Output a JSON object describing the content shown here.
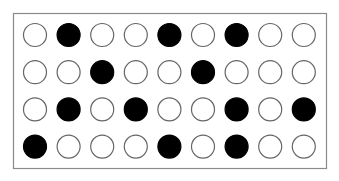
{
  "figure": {
    "rows": 4,
    "columns": 9,
    "colors": {
      "background": "#ffffff",
      "frame_stroke": "#8a8a8a",
      "circle_stroke": "#666666",
      "filled": "#000000",
      "hollow": "#ffffff"
    },
    "grid": [
      [
        0,
        1,
        0,
        0,
        1,
        0,
        1,
        0,
        0
      ],
      [
        0,
        0,
        1,
        0,
        0,
        1,
        0,
        0,
        0
      ],
      [
        0,
        1,
        0,
        1,
        0,
        0,
        1,
        0,
        1
      ],
      [
        1,
        0,
        0,
        0,
        1,
        0,
        1,
        0,
        0
      ]
    ],
    "filled_count": 12,
    "hollow_count": 24
  }
}
